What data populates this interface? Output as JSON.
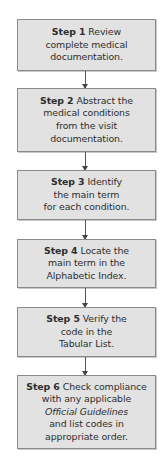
{
  "diagram": {
    "type": "flowchart",
    "direction": "top-to-bottom",
    "colors": {
      "box_fill": "#e2e2e2",
      "box_border": "#8a8a8a",
      "text": "#2e2e2e",
      "connector": "#555555"
    },
    "steps": [
      {
        "label": "Step 1",
        "lines": [
          "Review",
          "complete medical",
          "documentation."
        ]
      },
      {
        "label": "Step 2",
        "lines": [
          "Abstract the",
          "medical conditions",
          "from the visit",
          "documentation."
        ]
      },
      {
        "label": "Step 3",
        "lines": [
          "Identify",
          "the main term",
          "for each condition."
        ]
      },
      {
        "label": "Step 4",
        "lines": [
          "Locate the",
          "main term in the",
          "Alphabetic Index."
        ]
      },
      {
        "label": "Step 5",
        "lines": [
          "Verify the",
          "code in the",
          "Tabular List."
        ]
      },
      {
        "label": "Step 6",
        "lines": [
          "Check compliance",
          "with any applicable",
          "Official Guidelines",
          "and list codes in",
          "appropriate order."
        ],
        "italic_line": "Official Guidelines"
      }
    ],
    "connections": [
      {
        "from": "Step 1",
        "to": "Step 2"
      },
      {
        "from": "Step 2",
        "to": "Step 3"
      },
      {
        "from": "Step 3",
        "to": "Step 4"
      },
      {
        "from": "Step 4",
        "to": "Step 5"
      },
      {
        "from": "Step 5",
        "to": "Step 6"
      }
    ]
  }
}
